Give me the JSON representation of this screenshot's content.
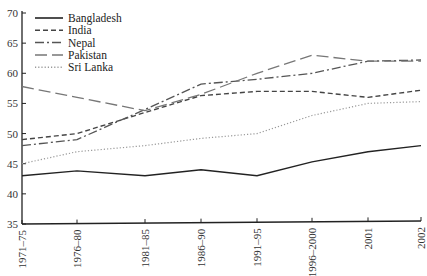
{
  "chart_data": {
    "type": "line",
    "title": "",
    "xlabel": "",
    "ylabel": "",
    "ylim": [
      35,
      70
    ],
    "yticks": [
      35,
      40,
      45,
      50,
      55,
      60,
      65,
      70
    ],
    "grid": false,
    "legend_position": "upper-left",
    "categories": [
      "1971–75",
      "1976–80",
      "1981–85",
      "1986–90",
      "1991–95",
      "1996–2000",
      "2001",
      "2002"
    ],
    "series": [
      {
        "name": "Bangladesh",
        "style": "solid",
        "color": "#222222",
        "values": [
          43,
          43.8,
          43,
          44,
          43,
          45.3,
          47,
          48
        ]
      },
      {
        "name": "India",
        "style": "dashed",
        "color": "#444444",
        "values": [
          49,
          50,
          53.5,
          56.3,
          57,
          57,
          56,
          57.2
        ]
      },
      {
        "name": "Nepal",
        "style": "dash-dot",
        "color": "#555555",
        "values": [
          48,
          49,
          54,
          58.2,
          59,
          60,
          62,
          62.2
        ]
      },
      {
        "name": "Pakistan",
        "style": "long-dash",
        "color": "#777777",
        "values": [
          57.8,
          56,
          53.8,
          56.5,
          60,
          63,
          62,
          62
        ]
      },
      {
        "name": "Sri Lanka",
        "style": "dotted",
        "color": "#999999",
        "values": [
          45,
          47,
          48,
          49.2,
          50,
          53,
          55,
          55.3
        ]
      }
    ]
  }
}
